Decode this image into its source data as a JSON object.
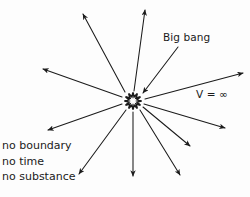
{
  "diagram": {
    "background_color": "#fdfdfd",
    "ink_color": "#1b1b1b",
    "labels": {
      "big_bang": "Big bang",
      "velocity": "V = ∞"
    },
    "notes": [
      "no boundary",
      "no time",
      "no substance"
    ],
    "center": {
      "x": 133,
      "y": 101
    },
    "burst": {
      "name": "big-bang-starburst",
      "spikes": 12,
      "inner_radius": 4.2,
      "outer_radius": 8.6
    },
    "arrows": [
      {
        "name": "arrow-up-left-steep",
        "x1": 125,
        "y1": 92,
        "x2": 83,
        "y2": 14
      },
      {
        "name": "arrow-up",
        "x1": 134,
        "y1": 91,
        "x2": 145,
        "y2": 10
      },
      {
        "name": "arrow-up-left-shallow",
        "x1": 122,
        "y1": 97,
        "x2": 43,
        "y2": 69
      },
      {
        "name": "arrow-left-down",
        "x1": 122,
        "y1": 104,
        "x2": 48,
        "y2": 130
      },
      {
        "name": "arrow-down-left",
        "x1": 126,
        "y1": 110,
        "x2": 79,
        "y2": 174
      },
      {
        "name": "arrow-down",
        "x1": 133,
        "y1": 112,
        "x2": 133,
        "y2": 176
      },
      {
        "name": "arrow-down-right",
        "x1": 140,
        "y1": 110,
        "x2": 180,
        "y2": 175
      },
      {
        "name": "arrow-right-down-mid",
        "x1": 143,
        "y1": 107,
        "x2": 190,
        "y2": 146
      },
      {
        "name": "arrow-right-down-low",
        "x1": 144,
        "y1": 104,
        "x2": 225,
        "y2": 128
      },
      {
        "name": "arrow-right-up",
        "x1": 145,
        "y1": 99,
        "x2": 243,
        "y2": 73
      }
    ],
    "leader": {
      "name": "big-bang-leader-arrow",
      "x1": 178,
      "y1": 47,
      "x2": 143,
      "y2": 93
    }
  }
}
